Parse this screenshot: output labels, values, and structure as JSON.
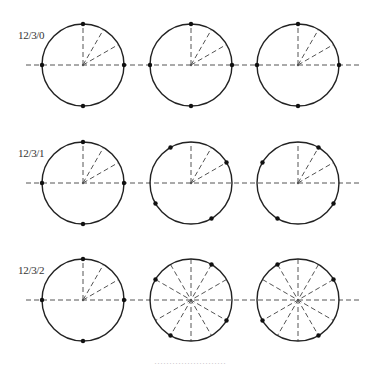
{
  "rows": [
    {
      "label": "12/3/0",
      "center_y": 65
    },
    {
      "label": "12/3/1",
      "center_y": 183
    },
    {
      "label": "12/3/2",
      "center_y": 300
    }
  ],
  "columns_center_x": [
    83,
    191,
    298
  ],
  "radius": 41,
  "circles": [
    [
      {
        "dots_deg": [
          90,
          0,
          270,
          180
        ],
        "spokes": "partial"
      },
      {
        "dots_deg": [
          90,
          0,
          270,
          180
        ],
        "spokes": "partial"
      },
      {
        "dots_deg": [
          90,
          0,
          270,
          180
        ],
        "spokes": "partial"
      }
    ],
    [
      {
        "dots_deg": [
          90,
          0,
          270,
          180
        ],
        "spokes": "partial"
      },
      {
        "dots_deg": [
          120,
          30,
          300,
          210
        ],
        "spokes": "partial"
      },
      {
        "dots_deg": [
          60,
          150,
          240,
          330
        ],
        "spokes": "partial"
      }
    ],
    [
      {
        "dots_deg": [
          90,
          0,
          270,
          180
        ],
        "spokes": "partial"
      },
      {
        "dots_deg": [
          60,
          150,
          240,
          330
        ],
        "spokes": "full"
      },
      {
        "dots_deg": [
          120,
          30,
          300,
          210
        ],
        "spokes": "full"
      }
    ]
  ],
  "caption": "……………………"
}
